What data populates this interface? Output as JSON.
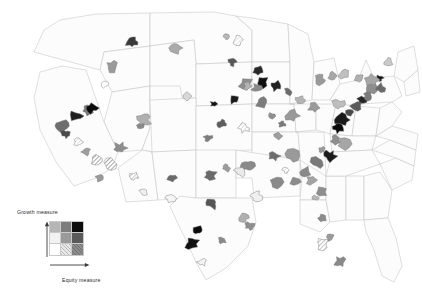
{
  "figure": {
    "type": "bivariate-choropleth-map",
    "region": "United States",
    "background_color": "#ffffff",
    "state_outline_color": "#c4c4c4",
    "metro_outline_color": "#8a8a8a"
  },
  "legend": {
    "y_axis_label": "Growth measure",
    "x_axis_label": "Equity measure",
    "grid_rows": 3,
    "grid_cols": 3,
    "y_direction": "up",
    "x_direction": "right",
    "cells": [
      {
        "row": 0,
        "col": 0,
        "fill": "#b4b4b4",
        "texture": "hatch"
      },
      {
        "row": 0,
        "col": 1,
        "fill": "#7d7d7d",
        "texture": "solid"
      },
      {
        "row": 0,
        "col": 2,
        "fill": "#0d0d0d",
        "texture": "solid"
      },
      {
        "row": 1,
        "col": 0,
        "fill": "#f2f2f2",
        "texture": "solid"
      },
      {
        "row": 1,
        "col": 1,
        "fill": "#9a9a9a",
        "texture": "solid"
      },
      {
        "row": 1,
        "col": 2,
        "fill": "#5a5a5a",
        "texture": "solid"
      },
      {
        "row": 2,
        "col": 0,
        "fill": "#ffffff",
        "texture": "solid"
      },
      {
        "row": 2,
        "col": 1,
        "fill": "#e8e8e8",
        "texture": "hatch"
      },
      {
        "row": 2,
        "col": 2,
        "fill": "#8c8c8c",
        "texture": "hatch"
      }
    ]
  },
  "chart_data": {
    "type": "map",
    "title": "",
    "xlabel": "Equity measure",
    "ylabel": "Growth measure",
    "legend_position": "bottom-left",
    "value_encoding": "bivariate 3x3 gray scale; darker = higher on both measures",
    "metros": [
      {
        "name": "Seattle",
        "x": 132,
        "y": 42,
        "fill": "#3a3a3a",
        "texture": "solid"
      },
      {
        "name": "Portland",
        "x": 112,
        "y": 66,
        "fill": "#9a9a9a",
        "texture": "solid"
      },
      {
        "name": "Eugene",
        "x": 104,
        "y": 84,
        "fill": "#ffffff",
        "texture": "solid"
      },
      {
        "name": "Spokane",
        "x": 176,
        "y": 48,
        "fill": "#aaaaaa",
        "texture": "solid"
      },
      {
        "name": "Boise",
        "x": 186,
        "y": 96,
        "fill": "#d8d8d8",
        "texture": "solid"
      },
      {
        "name": "Reno",
        "x": 88,
        "y": 110,
        "fill": "#7a7a7a",
        "texture": "solid"
      },
      {
        "name": "Sacramento",
        "x": 76,
        "y": 116,
        "fill": "#1f1f1f",
        "texture": "solid"
      },
      {
        "name": "San Francisco Bay Area",
        "x": 62,
        "y": 126,
        "fill": "#6e6e6e",
        "texture": "solid"
      },
      {
        "name": "San Jose",
        "x": 66,
        "y": 134,
        "fill": "#4a4a4a",
        "texture": "solid"
      },
      {
        "name": "Fresno",
        "x": 78,
        "y": 142,
        "fill": "#e2e2e2",
        "texture": "hatch"
      },
      {
        "name": "Bakersfield",
        "x": 86,
        "y": 152,
        "fill": "#9e9e9e",
        "texture": "solid"
      },
      {
        "name": "Los Angeles",
        "x": 98,
        "y": 160,
        "fill": "#8e8e8e",
        "texture": "hatch"
      },
      {
        "name": "Riverside",
        "x": 110,
        "y": 164,
        "fill": "#8a8a8a",
        "texture": "hatch"
      },
      {
        "name": "San Diego",
        "x": 100,
        "y": 178,
        "fill": "#9a9a9a",
        "texture": "solid"
      },
      {
        "name": "Las Vegas",
        "x": 120,
        "y": 148,
        "fill": "#8d8d8d",
        "texture": "solid"
      },
      {
        "name": "Salt Lake City",
        "x": 144,
        "y": 120,
        "fill": "#b0b0b0",
        "texture": "solid"
      },
      {
        "name": "Phoenix",
        "x": 134,
        "y": 176,
        "fill": "#a0a0a0",
        "texture": "hatch"
      },
      {
        "name": "Tucson",
        "x": 144,
        "y": 192,
        "fill": "#f0f0f0",
        "texture": "solid"
      },
      {
        "name": "Denver",
        "x": 92,
        "y": 108,
        "fill": "#0a0a0a",
        "texture": "solid"
      },
      {
        "name": "Colorado Springs",
        "x": 140,
        "y": 126,
        "fill": "#8a8a8a",
        "texture": "solid"
      },
      {
        "name": "Albuquerque",
        "x": 172,
        "y": 178,
        "fill": "#6a6a6a",
        "texture": "solid"
      },
      {
        "name": "El Paso",
        "x": 170,
        "y": 198,
        "fill": "#f4f4f4",
        "texture": "solid"
      },
      {
        "name": "Billings",
        "x": 226,
        "y": 36,
        "fill": "#b6b6b6",
        "texture": "solid"
      },
      {
        "name": "Minneapolis St Paul",
        "x": 232,
        "y": 62,
        "fill": "#585858",
        "texture": "solid"
      },
      {
        "name": "Duluth",
        "x": 238,
        "y": 40,
        "fill": "#dcdcdc",
        "texture": "hatch"
      },
      {
        "name": "Fargo",
        "x": 262,
        "y": 82,
        "fill": "#101010",
        "texture": "solid"
      },
      {
        "name": "Sioux Falls",
        "x": 246,
        "y": 84,
        "fill": "#8e8e8e",
        "texture": "solid"
      },
      {
        "name": "Omaha",
        "x": 214,
        "y": 104,
        "fill": "#121212",
        "texture": "solid"
      },
      {
        "name": "Des Moines",
        "x": 234,
        "y": 100,
        "fill": "#1a1a1a",
        "texture": "solid"
      },
      {
        "name": "Kansas City",
        "x": 222,
        "y": 124,
        "fill": "#5e5e5e",
        "texture": "solid"
      },
      {
        "name": "Wichita",
        "x": 208,
        "y": 138,
        "fill": "#7e7e7e",
        "texture": "solid"
      },
      {
        "name": "Oklahoma City",
        "x": 210,
        "y": 176,
        "fill": "#6a6a6a",
        "texture": "solid"
      },
      {
        "name": "Tulsa",
        "x": 226,
        "y": 168,
        "fill": "#9c9c9c",
        "texture": "solid"
      },
      {
        "name": "Dallas Fort Worth",
        "x": 212,
        "y": 204,
        "fill": "#555555",
        "texture": "solid"
      },
      {
        "name": "Austin",
        "x": 198,
        "y": 230,
        "fill": "#0c0c0c",
        "texture": "solid"
      },
      {
        "name": "San Antonio",
        "x": 192,
        "y": 244,
        "fill": "#111111",
        "texture": "solid"
      },
      {
        "name": "Houston",
        "x": 222,
        "y": 240,
        "fill": "#8a8a8a",
        "texture": "solid"
      },
      {
        "name": "Corpus Christi",
        "x": 202,
        "y": 262,
        "fill": "#f2f2f2",
        "texture": "solid"
      },
      {
        "name": "Chicago",
        "x": 262,
        "y": 102,
        "fill": "#7c7c7c",
        "texture": "solid"
      },
      {
        "name": "Milwaukee",
        "x": 258,
        "y": 88,
        "fill": "#8a8a8a",
        "texture": "solid"
      },
      {
        "name": "Madison",
        "x": 248,
        "y": 86,
        "fill": "#b2b2b2",
        "texture": "solid"
      },
      {
        "name": "Green Bay",
        "x": 258,
        "y": 70,
        "fill": "#282828",
        "texture": "solid"
      },
      {
        "name": "Detroit",
        "x": 288,
        "y": 92,
        "fill": "#6c6c6c",
        "texture": "solid"
      },
      {
        "name": "Grand Rapids",
        "x": 276,
        "y": 86,
        "fill": "#202020",
        "texture": "solid"
      },
      {
        "name": "Indianapolis",
        "x": 272,
        "y": 116,
        "fill": "#8f8f8f",
        "texture": "solid"
      },
      {
        "name": "Columbus",
        "x": 292,
        "y": 116,
        "fill": "#9a9a9a",
        "texture": "solid"
      },
      {
        "name": "Cleveland",
        "x": 300,
        "y": 100,
        "fill": "#b4b4b4",
        "texture": "solid"
      },
      {
        "name": "Cincinnati",
        "x": 282,
        "y": 124,
        "fill": "#7a7a7a",
        "texture": "solid"
      },
      {
        "name": "Louisville",
        "x": 278,
        "y": 136,
        "fill": "#9e9e9e",
        "texture": "solid"
      },
      {
        "name": "St Louis",
        "x": 244,
        "y": 128,
        "fill": "#e4e4e4",
        "texture": "hatch"
      },
      {
        "name": "Memphis",
        "x": 248,
        "y": 166,
        "fill": "#8a8a8a",
        "texture": "solid"
      },
      {
        "name": "Nashville",
        "x": 274,
        "y": 156,
        "fill": "#6e6e6e",
        "texture": "solid"
      },
      {
        "name": "Knoxville",
        "x": 292,
        "y": 156,
        "fill": "#9a9a9a",
        "texture": "solid"
      },
      {
        "name": "Birmingham",
        "x": 276,
        "y": 182,
        "fill": "#8a8a8a",
        "texture": "solid"
      },
      {
        "name": "Little Rock",
        "x": 240,
        "y": 172,
        "fill": "#eaeaea",
        "texture": "solid"
      },
      {
        "name": "New Orleans",
        "x": 250,
        "y": 226,
        "fill": "#8e8e8e",
        "texture": "solid"
      },
      {
        "name": "Baton Rouge",
        "x": 244,
        "y": 218,
        "fill": "#b0b0b0",
        "texture": "solid"
      },
      {
        "name": "Jackson",
        "x": 256,
        "y": 196,
        "fill": "#f0f0f0",
        "texture": "solid"
      },
      {
        "name": "Atlanta",
        "x": 296,
        "y": 182,
        "fill": "#8c8c8c",
        "texture": "solid"
      },
      {
        "name": "Chattanooga",
        "x": 286,
        "y": 170,
        "fill": "#dcdcdc",
        "texture": "hatch"
      },
      {
        "name": "Greenville",
        "x": 306,
        "y": 172,
        "fill": "#8a8a8a",
        "texture": "solid"
      },
      {
        "name": "Charlotte",
        "x": 318,
        "y": 162,
        "fill": "#7a7a7a",
        "texture": "solid"
      },
      {
        "name": "Raleigh Durham",
        "x": 330,
        "y": 156,
        "fill": "#1c1c1c",
        "texture": "solid"
      },
      {
        "name": "Greensboro",
        "x": 322,
        "y": 150,
        "fill": "#9a9a9a",
        "texture": "solid"
      },
      {
        "name": "Columbia",
        "x": 312,
        "y": 180,
        "fill": "#a4a4a4",
        "texture": "solid"
      },
      {
        "name": "Charleston SC",
        "x": 322,
        "y": 192,
        "fill": "#8e8e8e",
        "texture": "solid"
      },
      {
        "name": "Savannah",
        "x": 316,
        "y": 198,
        "fill": "#b8b8b8",
        "texture": "solid"
      },
      {
        "name": "Jacksonville",
        "x": 322,
        "y": 218,
        "fill": "#8a8a8a",
        "texture": "solid"
      },
      {
        "name": "Orlando",
        "x": 330,
        "y": 238,
        "fill": "#9a9a9a",
        "texture": "solid"
      },
      {
        "name": "Tampa",
        "x": 322,
        "y": 244,
        "fill": "#b2b2b2",
        "texture": "hatch"
      },
      {
        "name": "Miami",
        "x": 340,
        "y": 262,
        "fill": "#8a8a8a",
        "texture": "solid"
      },
      {
        "name": "Richmond",
        "x": 336,
        "y": 140,
        "fill": "#8e8e8e",
        "texture": "solid"
      },
      {
        "name": "Virginia Beach",
        "x": 344,
        "y": 144,
        "fill": "#a6a6a6",
        "texture": "solid"
      },
      {
        "name": "Washington DC",
        "x": 338,
        "y": 128,
        "fill": "#0a0a0a",
        "texture": "solid"
      },
      {
        "name": "Baltimore",
        "x": 342,
        "y": 120,
        "fill": "#1a1a1a",
        "texture": "solid"
      },
      {
        "name": "Philadelphia",
        "x": 350,
        "y": 112,
        "fill": "#4a4a4a",
        "texture": "solid"
      },
      {
        "name": "Pittsburgh",
        "x": 314,
        "y": 108,
        "fill": "#9a9a9a",
        "texture": "solid"
      },
      {
        "name": "Harrisburg",
        "x": 338,
        "y": 104,
        "fill": "#bebebe",
        "texture": "solid"
      },
      {
        "name": "New York",
        "x": 362,
        "y": 100,
        "fill": "#262626",
        "texture": "solid"
      },
      {
        "name": "Newark",
        "x": 356,
        "y": 106,
        "fill": "#5a5a5a",
        "texture": "solid"
      },
      {
        "name": "Bridgeport",
        "x": 368,
        "y": 96,
        "fill": "#7a7a7a",
        "texture": "solid"
      },
      {
        "name": "Hartford",
        "x": 372,
        "y": 88,
        "fill": "#8e8e8e",
        "texture": "solid"
      },
      {
        "name": "Providence",
        "x": 380,
        "y": 88,
        "fill": "#6a6a6a",
        "texture": "solid"
      },
      {
        "name": "Boston",
        "x": 380,
        "y": 78,
        "fill": "#141414",
        "texture": "solid"
      },
      {
        "name": "Worcester",
        "x": 372,
        "y": 80,
        "fill": "#a6a6a6",
        "texture": "solid"
      },
      {
        "name": "Albany",
        "x": 358,
        "y": 78,
        "fill": "#b0b0b0",
        "texture": "solid"
      },
      {
        "name": "Syracuse",
        "x": 344,
        "y": 74,
        "fill": "#c0c0c0",
        "texture": "solid"
      },
      {
        "name": "Rochester",
        "x": 332,
        "y": 76,
        "fill": "#a8a8a8",
        "texture": "solid"
      },
      {
        "name": "Buffalo",
        "x": 320,
        "y": 80,
        "fill": "#9a9a9a",
        "texture": "solid"
      },
      {
        "name": "Portland ME",
        "x": 388,
        "y": 62,
        "fill": "#cacaca",
        "texture": "solid"
      }
    ]
  }
}
